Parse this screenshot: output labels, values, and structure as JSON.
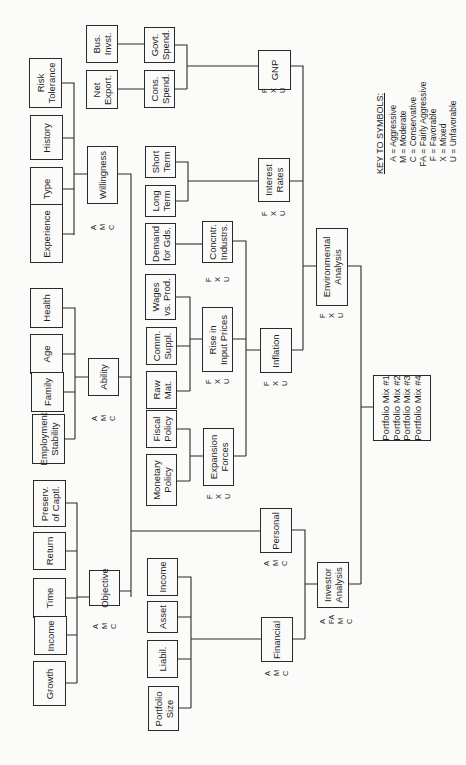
{
  "diagram": {
    "type": "hierarchical decision flowchart (rotated 90°)",
    "root": "Portfolio Mix",
    "nodes": {
      "risk_tolerance": "Risk\nTolerance",
      "history": "History",
      "type": "Type",
      "experience": "Experience",
      "willingness": "Willingness",
      "health": "Health",
      "age": "Age",
      "family": "Family",
      "employment_stability": "Employment\nStability",
      "ability": "Ability",
      "preserv_captl": "Preserv.\nof Captl.",
      "return": "Return",
      "time": "Time",
      "income_obj": "Income",
      "growth": "Growth",
      "objective": "Objective",
      "bus_invst": "Bus.\nInvst.",
      "net_export": "Net\nExport.",
      "govt_spend": "Govt.\nSpend.",
      "cons_spend": "Cons.\nSpend.",
      "gnp": "GNP",
      "short_term": "Short\nTerm",
      "long_term": "Long\nTerm",
      "interest_rates": "Interest\nRates",
      "demand_gds": "Demand\nfor Gds.",
      "concntr_industrs": "Concntr.\nIndustrs.",
      "wages_prod": "Wages\nvs. Prod.",
      "comm_suppl": "Comm.\nSuppl.",
      "raw_mat": "Raw\nMat.",
      "rise_input_prices": "Rise in\nInput Prices",
      "fiscal_policy": "Fiscal\nPolicy",
      "monetary_policy": "Monetary\nPolicy",
      "expansion_forces": "Expansion\nForces",
      "inflation": "Inflation",
      "environmental_analysis": "Environmental\nAnalysis",
      "income_fin": "Income",
      "asset": "Asset",
      "liabil": "Liabil.",
      "portfolio_size": "Portfolio\nSize",
      "personal": "Personal",
      "financial": "Financial",
      "investor_analysis": "Investor\nAnalysis",
      "portfolio_mix": "Portfolio Mix #1\nPortfolio Mix #2\nPortfolio Mix #3\nPortfolio Mix #4"
    },
    "ratings": {
      "amc": "A\nM\nC",
      "fxu": "F\nX\nU",
      "afamc": "A\nFA\nM\nC"
    },
    "edges": [
      [
        "risk_tolerance",
        "willingness"
      ],
      [
        "history",
        "willingness"
      ],
      [
        "type",
        "willingness"
      ],
      [
        "experience",
        "willingness"
      ],
      [
        "health",
        "ability"
      ],
      [
        "age",
        "ability"
      ],
      [
        "family",
        "ability"
      ],
      [
        "employment_stability",
        "ability"
      ],
      [
        "preserv_captl",
        "objective"
      ],
      [
        "return",
        "objective"
      ],
      [
        "time",
        "objective"
      ],
      [
        "income_obj",
        "objective"
      ],
      [
        "growth",
        "objective"
      ],
      [
        "willingness",
        "personal"
      ],
      [
        "ability",
        "personal"
      ],
      [
        "objective",
        "personal"
      ],
      [
        "bus_invst",
        "govt_spend"
      ],
      [
        "net_export",
        "cons_spend"
      ],
      [
        "govt_spend",
        "gnp"
      ],
      [
        "cons_spend",
        "gnp"
      ],
      [
        "short_term",
        "interest_rates"
      ],
      [
        "long_term",
        "interest_rates"
      ],
      [
        "demand_gds",
        "concntr_industrs"
      ],
      [
        "wages_prod",
        "rise_input_prices"
      ],
      [
        "comm_suppl",
        "rise_input_prices"
      ],
      [
        "raw_mat",
        "rise_input_prices"
      ],
      [
        "fiscal_policy",
        "expansion_forces"
      ],
      [
        "monetary_policy",
        "expansion_forces"
      ],
      [
        "concntr_industrs",
        "inflation"
      ],
      [
        "rise_input_prices",
        "inflation"
      ],
      [
        "expansion_forces",
        "inflation"
      ],
      [
        "gnp",
        "environmental_analysis"
      ],
      [
        "interest_rates",
        "environmental_analysis"
      ],
      [
        "inflation",
        "environmental_analysis"
      ],
      [
        "income_fin",
        "financial"
      ],
      [
        "asset",
        "financial"
      ],
      [
        "liabil",
        "financial"
      ],
      [
        "portfolio_size",
        "financial"
      ],
      [
        "personal",
        "investor_analysis"
      ],
      [
        "financial",
        "investor_analysis"
      ],
      [
        "environmental_analysis",
        "portfolio_mix"
      ],
      [
        "investor_analysis",
        "portfolio_mix"
      ]
    ]
  },
  "key": {
    "title": "KEY TO SYMBOLS:",
    "items": [
      {
        "k": "A",
        "v": "Aggressive"
      },
      {
        "k": "M",
        "v": "Moderate"
      },
      {
        "k": "C",
        "v": "Conservative"
      },
      {
        "k": "FA",
        "v": "Fairly Aggressive"
      },
      {
        "k": "F",
        "v": "Favorable"
      },
      {
        "k": "X",
        "v": "Mixed"
      },
      {
        "k": "U",
        "v": "Unfavorable"
      }
    ]
  }
}
